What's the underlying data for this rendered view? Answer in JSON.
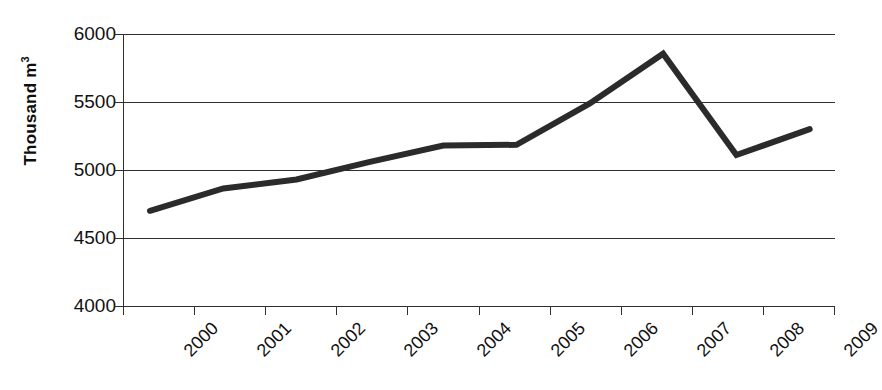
{
  "chart_data": {
    "type": "line",
    "title": "",
    "xlabel": "",
    "ylabel": "Thousand m³",
    "categories": [
      "2000",
      "2001",
      "2002",
      "2003",
      "2004",
      "2005",
      "2006",
      "2007",
      "2008",
      "2009"
    ],
    "series": [
      {
        "name": "Volume",
        "values": [
          4700,
          4865,
          4930,
          5060,
          5180,
          5185,
          5490,
          5855,
          5110,
          5300
        ]
      }
    ],
    "ylim": [
      4000,
      6000
    ],
    "yticks": [
      4000,
      4500,
      5000,
      5500,
      6000
    ],
    "ytick_labels": [
      "4000",
      "4500",
      "5000",
      "5500",
      "6000"
    ],
    "grid": true,
    "legend": "none",
    "line_color": "#2b2b2b",
    "line_width": 6,
    "axis_color": "#2f2f2f",
    "background": "#ffffff",
    "xtick_rotation": -45
  },
  "axis": {
    "y_title_text": "Thousand m",
    "y_title_exponent": "3"
  }
}
